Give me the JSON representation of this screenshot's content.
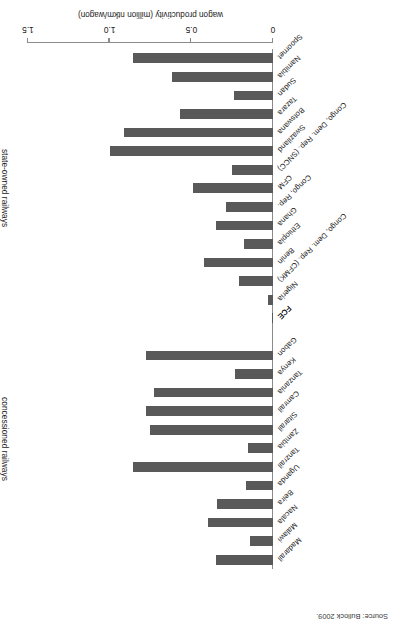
{
  "figure": {
    "source_note": "Source: Bullock 2009."
  },
  "chart_data": {
    "type": "bar",
    "orientation": "horizontal",
    "title": "",
    "xlabel": "wagon productivity (million ntkm/wagon)",
    "ylabel": "",
    "xlim": [
      0,
      1.5
    ],
    "xticks": [
      0,
      0.5,
      1.0,
      1.5
    ],
    "xtick_labels": [
      "0",
      "0.5",
      "1.0",
      "1.5"
    ],
    "grid": false,
    "legend": "none",
    "bar_color": "#595959",
    "axis_color": "#8b8b8b",
    "groups": [
      {
        "name": "state-owned railways"
      },
      {
        "name": "concessioned railways"
      }
    ],
    "categories": [
      "Spoornet",
      "Namibia",
      "Sudan",
      "Tazara",
      "Botswana",
      "Swaziland",
      "Congo, Dem. Rep. (SNCC)",
      "CFM",
      "Congo, Rep.",
      "Ghana",
      "Ethiopia",
      "Benin",
      "Congo, Dem. Rep. (CFMK)",
      "Nigeria",
      "FCE",
      "Gabon",
      "Kenya",
      "Tanzania",
      "Camrail",
      "Sitarail",
      "Zambia",
      "Tanzrail",
      "Uganda",
      "Beira",
      "Nacala",
      "Malawi",
      "Madarail"
    ],
    "values": [
      0.86,
      0.62,
      0.24,
      0.57,
      0.91,
      1.0,
      0.25,
      0.49,
      0.29,
      0.35,
      0.18,
      0.42,
      0.21,
      0.03,
      null,
      0.78,
      0.23,
      0.73,
      0.78,
      0.75,
      0.155,
      0.86,
      0.165,
      0.345,
      0.4,
      0.14,
      0.35
    ],
    "series": [
      {
        "name": "state-owned railways",
        "points": [
          {
            "label": "Spoornet",
            "value": 0.86
          },
          {
            "label": "Namibia",
            "value": 0.62
          },
          {
            "label": "Sudan",
            "value": 0.24
          },
          {
            "label": "Tazara",
            "value": 0.57
          },
          {
            "label": "Botswana",
            "value": 0.91
          },
          {
            "label": "Swaziland",
            "value": 1.0
          },
          {
            "label": "Congo, Dem. Rep. (SNCC)",
            "value": 0.25
          },
          {
            "label": "CFM",
            "value": 0.49
          },
          {
            "label": "Congo, Rep.",
            "value": 0.29
          },
          {
            "label": "Ghana",
            "value": 0.35
          },
          {
            "label": "Ethiopia",
            "value": 0.18
          },
          {
            "label": "Benin",
            "value": 0.42
          },
          {
            "label": "Congo, Dem. Rep. (CFMK)",
            "value": 0.21
          },
          {
            "label": "Nigeria",
            "value": 0.03
          },
          {
            "label": "FCE",
            "value": 0.0
          }
        ]
      },
      {
        "name": "concessioned railways",
        "points": [
          {
            "label": "Gabon",
            "value": 0.78
          },
          {
            "label": "Kenya",
            "value": 0.23
          },
          {
            "label": "Tanzania",
            "value": 0.73
          },
          {
            "label": "Camrail",
            "value": 0.78
          },
          {
            "label": "Sitarail",
            "value": 0.75
          },
          {
            "label": "Zambia",
            "value": 0.155
          },
          {
            "label": "Tanzrail",
            "value": 0.86
          },
          {
            "label": "Uganda",
            "value": 0.165
          },
          {
            "label": "Beira",
            "value": 0.345
          },
          {
            "label": "Nacala",
            "value": 0.4
          },
          {
            "label": "Malawi",
            "value": 0.14
          },
          {
            "label": "Madarail",
            "value": 0.35
          }
        ]
      }
    ]
  }
}
